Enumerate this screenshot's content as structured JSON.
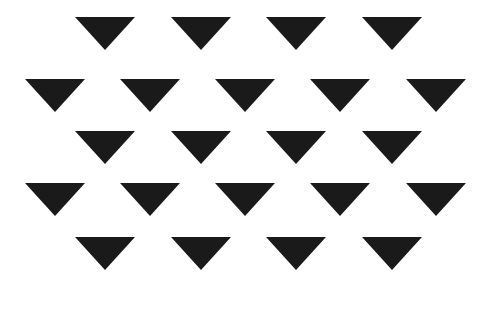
{
  "canvas": {
    "width": 485,
    "height": 311,
    "background_color": "#ffffff"
  },
  "pattern": {
    "shape_name": "downward-triangle",
    "shape_color": "#1a1a1a",
    "shape_width": 61,
    "shape_height": 33,
    "total_shapes": 22,
    "row_count": 5,
    "row_pitch": 55,
    "rows": [
      {
        "index": 1,
        "top": 17,
        "count": 4,
        "start_x": 75,
        "pitch": 96,
        "x_positions": [
          75,
          171,
          266,
          362
        ]
      },
      {
        "index": 2,
        "top": 79,
        "count": 5,
        "start_x": 25,
        "pitch": 95,
        "x_positions": [
          25,
          120,
          215,
          310,
          406
        ]
      },
      {
        "index": 3,
        "top": 131,
        "count": 4,
        "start_x": 75,
        "pitch": 96,
        "x_positions": [
          75,
          171,
          266,
          362
        ]
      },
      {
        "index": 4,
        "top": 183,
        "count": 5,
        "start_x": 25,
        "pitch": 95,
        "x_positions": [
          25,
          120,
          215,
          310,
          406
        ]
      },
      {
        "index": 5,
        "top": 237,
        "count": 4,
        "start_x": 75,
        "pitch": 96,
        "x_positions": [
          75,
          171,
          266,
          362
        ]
      }
    ]
  }
}
